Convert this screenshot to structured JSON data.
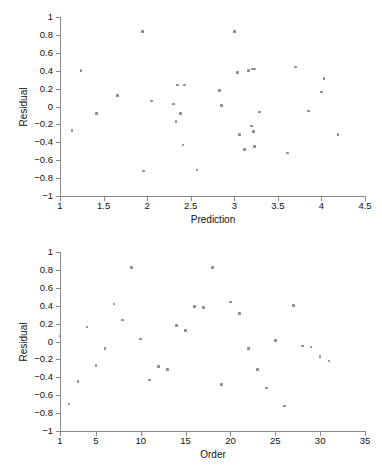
{
  "figure": {
    "title": "",
    "point_color": "#8d8d8d",
    "axis_color": "#8a8a8a",
    "background": "#ffffff"
  },
  "chart_data": [
    {
      "type": "scatter",
      "id": "residual-vs-prediction",
      "title": "",
      "xlabel": "Prediction",
      "ylabel": "Residual",
      "xlim": [
        1,
        4.5
      ],
      "ylim": [
        -1,
        1
      ],
      "xticks": [
        1,
        1.5,
        2,
        2.5,
        3,
        3.5,
        4,
        4.5
      ],
      "xticklabels": [
        "1",
        "1.5",
        "2",
        "2.5",
        "3",
        "3.5",
        "4",
        "4.5"
      ],
      "yticks": [
        -1,
        -0.8,
        -0.6,
        -0.4,
        -0.2,
        0,
        0.2,
        0.4,
        0.6,
        0.8,
        1
      ],
      "yticklabels": [
        "−1",
        "−0.8",
        "−0.6",
        "−0.4",
        "−0.2",
        "0",
        "0.2",
        "0.4",
        "0.6",
        "0.8",
        "1"
      ],
      "grid": false,
      "legend": null,
      "x": [
        1.14,
        1.24,
        1.42,
        1.66,
        1.95,
        1.96,
        2.05,
        2.3,
        2.33,
        2.35,
        2.38,
        2.41,
        2.43,
        2.57,
        2.83,
        2.85,
        3.0,
        3.04,
        3.06,
        3.12,
        3.16,
        3.2,
        3.21,
        3.22,
        3.23,
        3.24,
        3.29,
        3.61,
        3.7,
        3.85,
        4.0,
        4.03,
        4.19
      ],
      "y": [
        -0.27,
        0.4,
        -0.08,
        0.12,
        0.84,
        -0.72,
        0.06,
        0.03,
        -0.17,
        0.24,
        -0.08,
        -0.43,
        0.24,
        -0.71,
        0.18,
        0.01,
        0.84,
        0.38,
        -0.31,
        -0.48,
        0.4,
        -0.22,
        0.42,
        -0.28,
        -0.45,
        0.42,
        -0.06,
        -0.52,
        0.44,
        -0.05,
        0.16,
        0.31,
        -0.31
      ]
    },
    {
      "type": "scatter",
      "id": "residual-vs-order",
      "title": "",
      "xlabel": "Order",
      "ylabel": "Residual",
      "xlim": [
        1,
        35
      ],
      "ylim": [
        -1,
        1
      ],
      "xticks": [
        1,
        5,
        10,
        15,
        20,
        25,
        30,
        35
      ],
      "xticklabels": [
        "1",
        "5",
        "10",
        "15",
        "20",
        "25",
        "30",
        "35"
      ],
      "yticks": [
        -1,
        -0.8,
        -0.6,
        -0.4,
        -0.2,
        0,
        0.2,
        0.4,
        0.6,
        0.8,
        1
      ],
      "yticklabels": [
        "−1",
        "−0.8",
        "−0.6",
        "−0.4",
        "−0.2",
        "0",
        "0.2",
        "0.4",
        "0.6",
        "0.8",
        "1"
      ],
      "grid": false,
      "legend": null,
      "x": [
        1,
        2,
        3,
        4,
        5,
        6,
        7,
        8,
        9,
        10,
        11,
        12,
        13,
        14,
        15,
        16,
        17,
        18,
        19,
        20,
        21,
        22,
        23,
        24,
        25,
        26,
        27,
        28,
        29,
        30,
        31
      ],
      "y": [
        0.06,
        -0.7,
        -0.45,
        0.16,
        -0.27,
        -0.08,
        0.42,
        0.24,
        0.83,
        0.03,
        -0.43,
        -0.28,
        -0.31,
        0.18,
        0.12,
        0.39,
        0.38,
        0.83,
        -0.48,
        0.44,
        0.31,
        -0.08,
        -0.31,
        -0.52,
        0.01,
        -0.72,
        0.4,
        -0.05,
        -0.06,
        -0.17,
        -0.22
      ]
    }
  ]
}
